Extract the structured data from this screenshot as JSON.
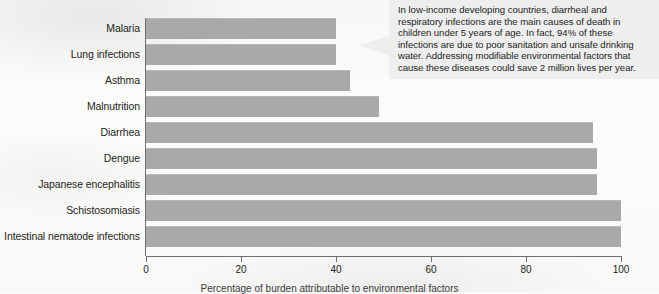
{
  "chart_data": {
    "type": "bar",
    "orientation": "horizontal",
    "title": "",
    "xlabel": "",
    "ylabel": "",
    "xlim": [
      0,
      100
    ],
    "xticks": [
      0,
      20,
      40,
      60,
      80,
      100
    ],
    "grid": false,
    "legend": null,
    "bar_color": "#a9a9a9",
    "categories": [
      "Malaria",
      "Lung infections",
      "Asthma",
      "Malnutrition",
      "Diarrhea",
      "Dengue",
      "Japanese encephalitis",
      "Schistosomiasis",
      "Intestinal nematode infections"
    ],
    "values": [
      40,
      40,
      43,
      49,
      94,
      95,
      95,
      100,
      100
    ]
  },
  "callout": {
    "text": "In low-income developing countries, diarrheal and respiratory infections are the main causes of death in children under 5 years of age. In fact, 94% of these infections are due to poor sanitation and unsafe drinking water. Addressing modifiable environmental factors that cause these diseases could save 2 million lives per year.",
    "background": "#eeeeee"
  },
  "caption": {
    "text": "Percentage of burden attributable to environmental factors"
  }
}
